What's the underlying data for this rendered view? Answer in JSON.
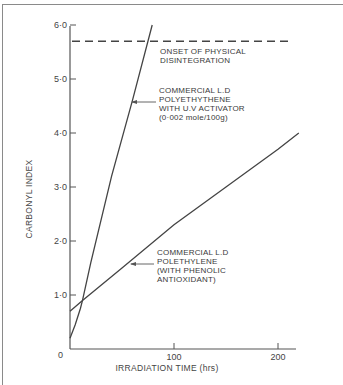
{
  "chart_data": {
    "type": "line",
    "title": "",
    "xlabel": "IRRADIATION TIME (hrs)",
    "ylabel": "CARBONYL INDEX",
    "xlim": [
      0,
      220
    ],
    "ylim": [
      0,
      6.0
    ],
    "x_ticks": [
      "0",
      "100",
      "200"
    ],
    "y_ticks": [
      "0",
      "1·0",
      "2·0",
      "3·0",
      "4·0",
      "5·0",
      "6·0"
    ],
    "grid": false,
    "legend": "none (direct annotations with arrows)",
    "series": [
      {
        "name": "COMMERCIAL L.D POLYETHYTHENE WITH U.V ACTIVATOR (0·002 mole/100g)",
        "x": [
          0,
          5,
          10,
          12,
          20,
          40,
          60,
          79
        ],
        "values": [
          0.2,
          0.45,
          0.75,
          0.9,
          1.6,
          3.2,
          4.6,
          6.0
        ]
      },
      {
        "name": "COMMERCIAL L.D POLETHYLENE (WITH PHENOLIC ANTIOXIDANT)",
        "x": [
          0,
          12,
          50,
          100,
          150,
          200,
          220
        ],
        "values": [
          0.7,
          0.9,
          1.5,
          2.3,
          3.0,
          3.7,
          4.0
        ]
      }
    ],
    "reference_lines": [
      {
        "type": "horizontal",
        "y": 5.7,
        "style": "dashed",
        "label": "ONSET OF PHYSICAL DISINTEGRATION"
      }
    ],
    "annotations": [
      {
        "lines": [
          "ONSET OF PHYSICAL",
          "DISINTEGRATION"
        ]
      },
      {
        "lines": [
          "COMMERCIAL  L.D",
          "POLYETHYTHENE",
          "WITH U.V ACTIVATOR",
          "(0·002 mole/100g)"
        ]
      },
      {
        "lines": [
          "COMMERCIAL  L.D",
          "POLETHYLENE",
          "(WITH PHENOLIC",
          "ANTIOXIDANT)"
        ]
      }
    ]
  }
}
